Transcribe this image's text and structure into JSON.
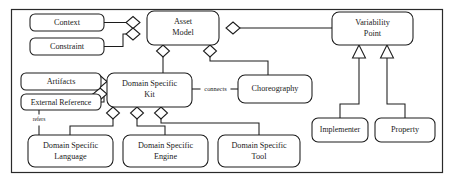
{
  "diagram": {
    "type": "uml-class-diagram",
    "frame": {
      "name": "diagram-frame",
      "x": 11,
      "y": 9,
      "width": 432,
      "height": 164
    },
    "style": {
      "line_color": "#1c1c1c",
      "box_fill": "#ffffff",
      "text_color": "#1a1a1a",
      "frame_color": "#2a2a2a"
    },
    "nodes": [
      {
        "id": "context",
        "label": "Context",
        "lines": [
          "Context"
        ],
        "x": 30,
        "y": 14,
        "width": 74,
        "height": 17,
        "rx": 5
      },
      {
        "id": "constraint",
        "label": "Constraint",
        "lines": [
          "Constraint"
        ],
        "x": 30,
        "y": 38,
        "width": 74,
        "height": 17,
        "rx": 5
      },
      {
        "id": "asset-model",
        "label": "Asset Model",
        "lines": [
          "Asset",
          "Model"
        ],
        "x": 147,
        "y": 11,
        "width": 72,
        "height": 34,
        "rx": 7
      },
      {
        "id": "variability-point",
        "label": "Variability Point",
        "lines": [
          "Variability",
          "Point"
        ],
        "x": 332,
        "y": 12,
        "width": 81,
        "height": 33,
        "rx": 7
      },
      {
        "id": "artifacts",
        "label": "Artifacts",
        "lines": [
          "Artifacts"
        ],
        "x": 21,
        "y": 73,
        "width": 80,
        "height": 17,
        "rx": 5
      },
      {
        "id": "external-reference",
        "label": "External Reference",
        "lines": [
          "External Reference"
        ],
        "x": 21,
        "y": 94,
        "width": 80,
        "height": 16,
        "rx": 5
      },
      {
        "id": "domain-specific-kit",
        "label": "Domain Specific Kit",
        "lines": [
          "Domain Specific",
          "Kit"
        ],
        "x": 107,
        "y": 73,
        "width": 85,
        "height": 34,
        "rx": 7
      },
      {
        "id": "choreography",
        "label": "Choreography",
        "lines": [
          "Choreography"
        ],
        "x": 238,
        "y": 75,
        "width": 74,
        "height": 28,
        "rx": 7
      },
      {
        "id": "implementer",
        "label": "Implementer",
        "lines": [
          "Implementer"
        ],
        "x": 312,
        "y": 118,
        "width": 56,
        "height": 24,
        "rx": 6
      },
      {
        "id": "property",
        "label": "Property",
        "lines": [
          "Property"
        ],
        "x": 375,
        "y": 118,
        "width": 60,
        "height": 24,
        "rx": 6
      },
      {
        "id": "domain-specific-language",
        "label": "Domain Specific Language",
        "lines": [
          "Domain Specific",
          "Language"
        ],
        "x": 28,
        "y": 135,
        "width": 85,
        "height": 32,
        "rx": 7
      },
      {
        "id": "domain-specific-engine",
        "label": "Domain Specific Engine",
        "lines": [
          "Domain Specific",
          "Engine"
        ],
        "x": 123,
        "y": 135,
        "width": 85,
        "height": 32,
        "rx": 7
      },
      {
        "id": "domain-specific-tool",
        "label": "Domain Specific Tool",
        "lines": [
          "Domain Specific",
          "Tool"
        ],
        "x": 218,
        "y": 135,
        "width": 82,
        "height": 32,
        "rx": 7
      }
    ],
    "edge_labels": [
      {
        "id": "connects-label",
        "text": "connects",
        "x": 215,
        "y": 85
      },
      {
        "id": "refers-label",
        "text": "refers",
        "x": 39,
        "y": 120
      }
    ],
    "relationships": [
      {
        "id": "context-to-asset-model",
        "from": "context",
        "to": "asset-model",
        "kind": "aggregation"
      },
      {
        "id": "constraint-to-asset-model",
        "from": "constraint",
        "to": "asset-model",
        "kind": "aggregation"
      },
      {
        "id": "asset-model-to-variability",
        "from": "variability-point",
        "to": "asset-model",
        "kind": "aggregation"
      },
      {
        "id": "asset-model-to-kit",
        "from": "asset-model",
        "to": "domain-specific-kit",
        "kind": "aggregation"
      },
      {
        "id": "asset-model-to-choreography",
        "from": "asset-model",
        "to": "choreography",
        "kind": "aggregation"
      },
      {
        "id": "artifacts-to-kit",
        "from": "artifacts",
        "to": "domain-specific-kit",
        "kind": "aggregation"
      },
      {
        "id": "external-reference-to-kit",
        "from": "external-reference",
        "to": "domain-specific-kit",
        "kind": "aggregation"
      },
      {
        "id": "kit-to-choreography",
        "from": "domain-specific-kit",
        "to": "choreography",
        "kind": "association",
        "label": "connects"
      },
      {
        "id": "kit-to-language",
        "from": "domain-specific-kit",
        "to": "domain-specific-language",
        "kind": "aggregation"
      },
      {
        "id": "kit-to-engine",
        "from": "domain-specific-kit",
        "to": "domain-specific-engine",
        "kind": "aggregation"
      },
      {
        "id": "kit-to-tool",
        "from": "domain-specific-kit",
        "to": "domain-specific-tool",
        "kind": "aggregation"
      },
      {
        "id": "external-reference-refers-language",
        "from": "external-reference",
        "to": "domain-specific-language",
        "kind": "association",
        "label": "refers"
      },
      {
        "id": "implementer-to-variability",
        "from": "implementer",
        "to": "variability-point",
        "kind": "generalization"
      },
      {
        "id": "property-to-variability",
        "from": "property",
        "to": "variability-point",
        "kind": "generalization"
      }
    ]
  }
}
